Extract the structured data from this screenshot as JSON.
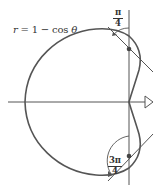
{
  "diagram": {
    "equation_label": "r = 1 − cos θ",
    "equation_parts": {
      "lhs": "r",
      "eq": " = 1 − ",
      "fn": "cos",
      "var": " θ"
    },
    "angles": [
      {
        "numerator": "π",
        "denominator": "4",
        "value": "π/4"
      },
      {
        "numerator": "3π",
        "denominator": "4",
        "value": "3π/4"
      }
    ],
    "curve": "cardioid",
    "colors": {
      "curve": "#555555",
      "axis": "#555555",
      "dot": "#444444",
      "text": "#333333"
    }
  }
}
